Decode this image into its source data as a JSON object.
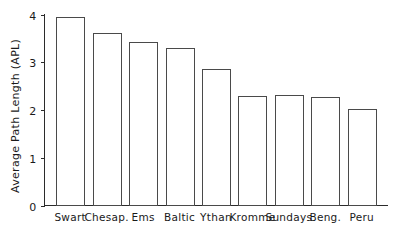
{
  "chart_data": {
    "type": "bar",
    "title": "",
    "xlabel": "",
    "ylabel": "Average Path Length (APL)",
    "categories": [
      "Swart",
      "Chesap.",
      "Ems",
      "Baltic",
      "Ythan",
      "Kromme",
      "Sundays",
      "Beng.",
      "Peru"
    ],
    "values": [
      3.95,
      3.62,
      3.42,
      3.3,
      2.85,
      2.3,
      2.31,
      2.28,
      2.02
    ],
    "ylim": [
      0,
      4
    ],
    "ytick_labels": [
      "0",
      "1",
      "2",
      "3",
      "4"
    ],
    "ytick_values": [
      0,
      1,
      2,
      3,
      4
    ],
    "grid": false,
    "legend": "none",
    "series": [
      {
        "name": "Average Path Length (APL)",
        "values": [
          3.95,
          3.62,
          3.42,
          3.3,
          2.85,
          2.3,
          2.31,
          2.28,
          2.02
        ]
      }
    ]
  },
  "style": {
    "bar_fill": "#ffffff",
    "bar_stroke": "#4a4a4a",
    "axis_color": "#2b2b2b",
    "text_color": "#1a1a1a",
    "background": "#ffffff"
  }
}
